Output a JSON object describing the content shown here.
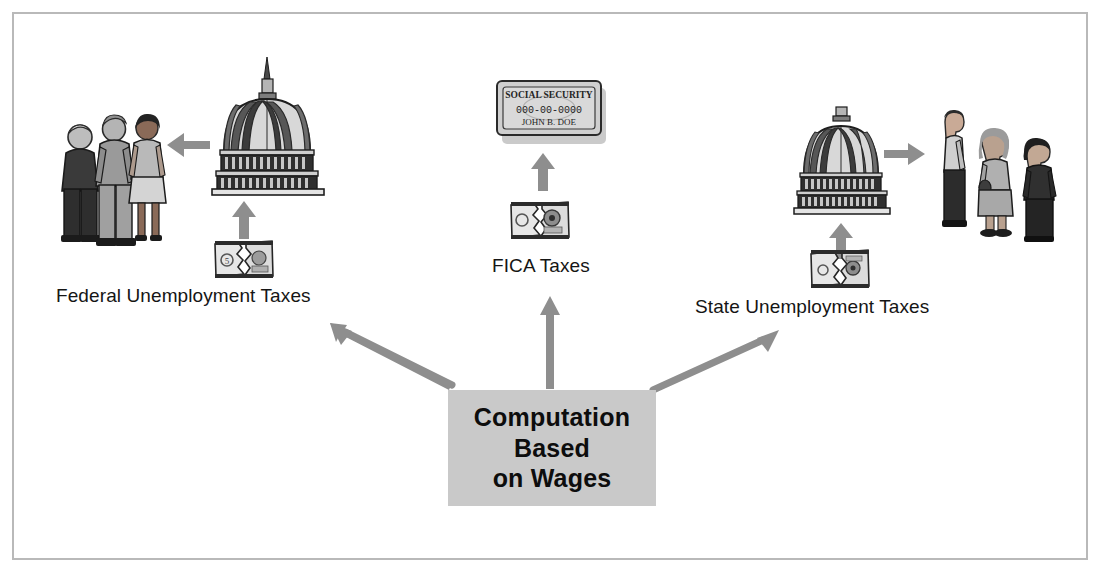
{
  "diagram": {
    "title_box": {
      "lines": [
        "Computation",
        "Based",
        "on Wages"
      ],
      "fill_color": "#c9c9c9"
    },
    "branches": [
      {
        "id": "federal",
        "label": "Federal Unemployment Taxes",
        "icon": "torn-dollar-bill-icon",
        "destination_icon": "capitol-dome-icon",
        "recipients_icon": "people-back-group-icon",
        "arrow_direction": "up-left"
      },
      {
        "id": "fica",
        "label": "FICA Taxes",
        "icon": "torn-dollar-bill-icon",
        "destination_icon": "social-security-card-icon",
        "card": {
          "heading": "SOCIAL SECURITY",
          "number": "000-00-0000",
          "name": "JOHN B. DOE"
        },
        "arrow_direction": "up"
      },
      {
        "id": "state",
        "label": "State Unemployment Taxes",
        "icon": "torn-dollar-bill-icon",
        "destination_icon": "capitol-dome-icon",
        "recipients_icon": "people-profile-group-icon",
        "arrow_direction": "up-right"
      }
    ],
    "colors": {
      "arrow": "#8e8e8e",
      "frame": "#b9b9b9",
      "box": "#c9c9c9",
      "text": "#151515"
    }
  }
}
